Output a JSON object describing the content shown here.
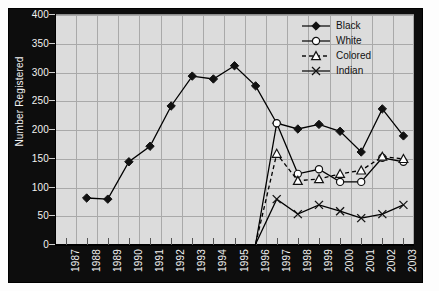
{
  "chart_data": {
    "type": "line",
    "title": "",
    "xlabel": "",
    "ylabel": "Number Registered",
    "ylim": [
      0,
      400
    ],
    "ytick_step": 50,
    "yticks": [
      0,
      50,
      100,
      150,
      200,
      250,
      300,
      350,
      400
    ],
    "grid": true,
    "legend_position": "top-right",
    "categories": [
      "1987",
      "1988",
      "1989",
      "1990",
      "1991",
      "1992",
      "1993",
      "1994",
      "1995",
      "1996",
      "1997",
      "1998",
      "1999",
      "2000",
      "2001",
      "2002",
      "2003"
    ],
    "series": [
      {
        "name": "Black",
        "marker": "filled-diamond",
        "line": "solid",
        "color": "#000000",
        "values": [
          null,
          80,
          78,
          143,
          170,
          240,
          292,
          287,
          310,
          275,
          210,
          200,
          208,
          196,
          160,
          235,
          188
        ]
      },
      {
        "name": "White",
        "marker": "open-circle",
        "line": "solid",
        "color": "#000000",
        "values": [
          null,
          null,
          null,
          null,
          null,
          null,
          null,
          null,
          null,
          0,
          210,
          122,
          130,
          108,
          108,
          150,
          143
        ]
      },
      {
        "name": "Colored",
        "marker": "open-triangle",
        "line": "dashed",
        "color": "#000000",
        "values": [
          null,
          null,
          null,
          null,
          null,
          null,
          null,
          null,
          null,
          0,
          157,
          110,
          113,
          122,
          128,
          152,
          148
        ]
      },
      {
        "name": "Indian",
        "marker": "cross",
        "line": "solid",
        "color": "#000000",
        "values": [
          null,
          null,
          null,
          null,
          null,
          null,
          null,
          null,
          null,
          0,
          78,
          52,
          68,
          57,
          45,
          52,
          68
        ]
      }
    ]
  },
  "legend": {
    "items": [
      {
        "label": "Black"
      },
      {
        "label": "White"
      },
      {
        "label": "Colored"
      },
      {
        "label": "Indian"
      }
    ]
  },
  "axes": {
    "y_title": "Number Registered"
  }
}
